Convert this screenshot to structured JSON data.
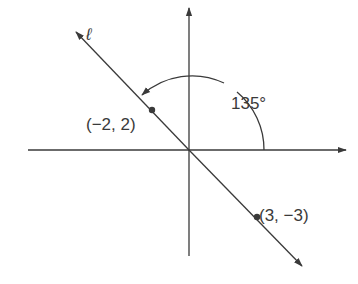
{
  "diagram": {
    "type": "coordinate-plane",
    "line_label": "ℓ",
    "angle_label": "135°",
    "angle_degrees": 135,
    "points": [
      {
        "label": "(−2, 2)",
        "x": -2,
        "y": 2
      },
      {
        "label": "(3, −3)",
        "x": 3,
        "y": -3
      }
    ],
    "colors": {
      "stroke": "#3a3a3a",
      "background": "#ffffff"
    }
  }
}
